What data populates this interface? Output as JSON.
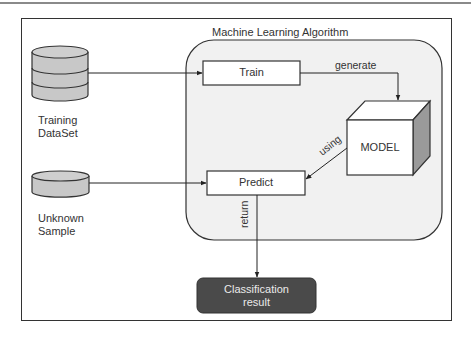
{
  "diagram": {
    "region_title": "Machine Learning Algorithm",
    "nodes": {
      "training_dataset": {
        "line1": "Training",
        "line2": "DataSet",
        "icon": "database-icon"
      },
      "unknown_sample": {
        "line1": "Unknown",
        "line2": "Sample",
        "icon": "database-icon"
      },
      "train": {
        "label": "Train"
      },
      "predict": {
        "label": "Predict"
      },
      "model": {
        "label": "MODEL",
        "icon": "cube-icon"
      },
      "classification_result": {
        "line1": "Classification",
        "line2": "result"
      }
    },
    "edges": {
      "generate": "generate",
      "using": "using",
      "return": "return"
    },
    "colors": {
      "region_fill": "#f1f1f1",
      "db_fill": "#c8c8c8",
      "result_fill": "#4a4a4a",
      "cube_side": "#9a9a9a",
      "stroke": "#333333"
    }
  }
}
